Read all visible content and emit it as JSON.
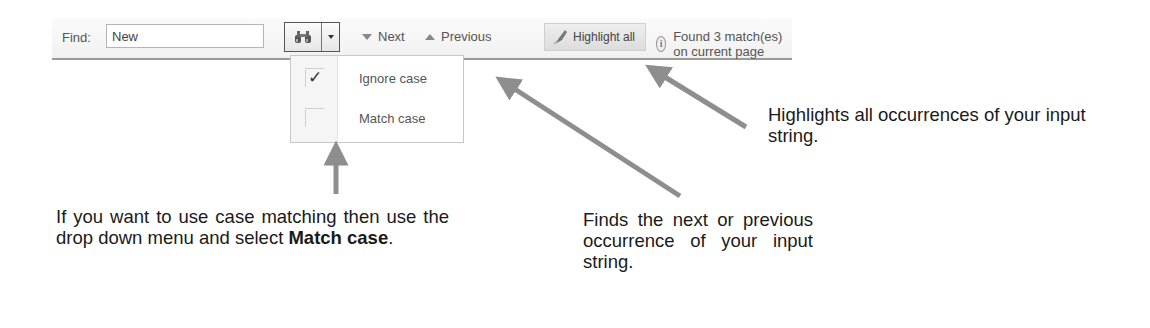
{
  "toolbar": {
    "find_label": "Find:",
    "find_value": "New",
    "search_icon": "binoculars-icon",
    "dropdown_icon": "chevron-down-icon",
    "next_label": "Next",
    "previous_label": "Previous",
    "highlight_label": "Highlight all",
    "status_text": "Found 3 match(es) on current page"
  },
  "dropdown": {
    "items": [
      {
        "label": "Ignore case",
        "checked": true,
        "check_glyph": "✓"
      },
      {
        "label": "Match case",
        "checked": false,
        "check_glyph": ""
      }
    ]
  },
  "annotations": {
    "case_pre": "If you want to use case matching then use the drop down menu and select ",
    "case_bold": "Match case",
    "case_post": ".",
    "nav": "Finds the next or previous occurrence of your input string.",
    "highlight": "Highlights all occurrences of your input string."
  },
  "colors": {
    "arrow": "#8e8e8e",
    "toolbar_border": "#9a9a9a",
    "text": "#1a1a1a"
  }
}
